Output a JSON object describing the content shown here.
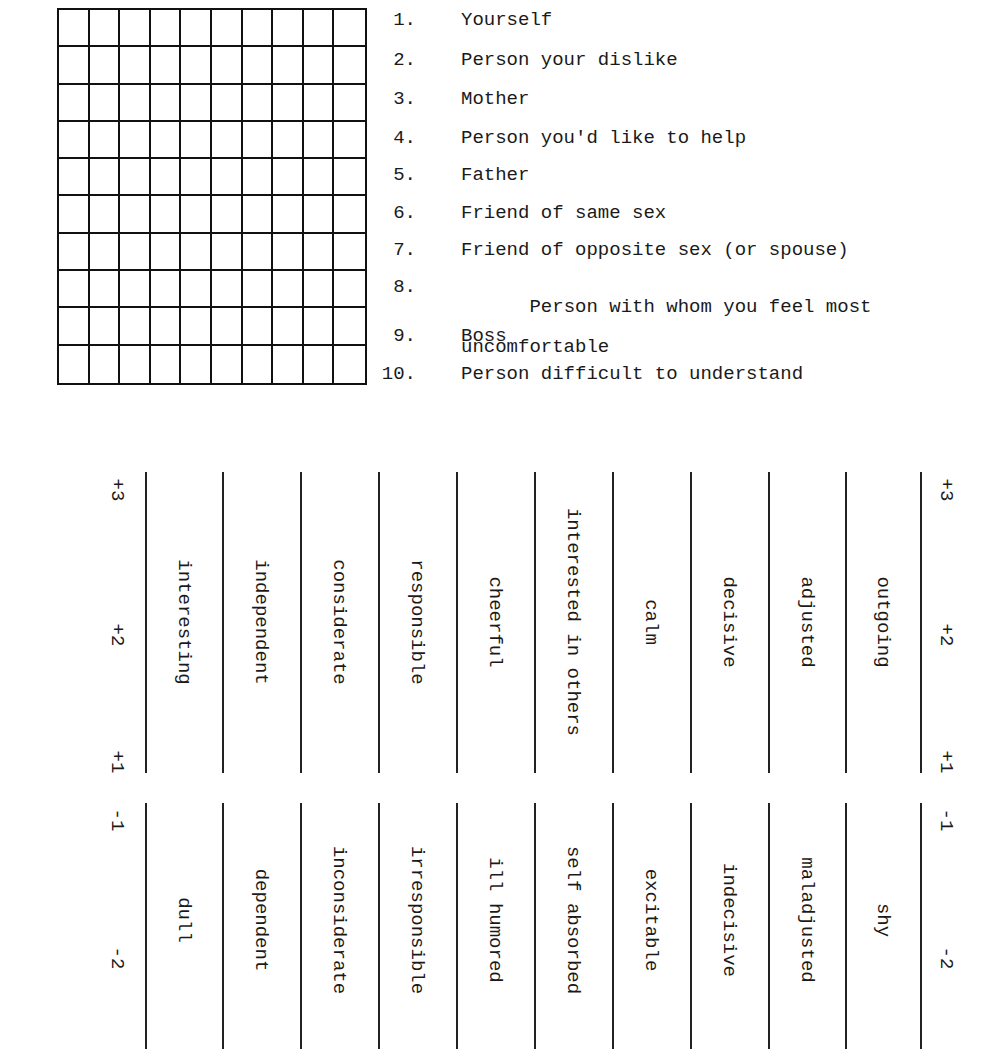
{
  "grid": {
    "rows": 10,
    "cols": 10
  },
  "people_list": [
    {
      "num": "1.",
      "label": "Yourself"
    },
    {
      "num": "2.",
      "label": "Person your dislike"
    },
    {
      "num": "3.",
      "label": "Mother"
    },
    {
      "num": "4.",
      "label": "Person you'd like to help"
    },
    {
      "num": "5.",
      "label": "Father"
    },
    {
      "num": "6.",
      "label": "Friend of same sex"
    },
    {
      "num": "7.",
      "label": "Friend of opposite sex (or spouse)"
    },
    {
      "num": "8.",
      "label": "Person with whom you feel most",
      "label_cont": "uncomfortable"
    },
    {
      "num": "9.",
      "label": "Boss"
    },
    {
      "num": "10.",
      "label": "Person difficult to understand"
    }
  ],
  "scale": {
    "positive_ticks": [
      "+3",
      "+2",
      "+1"
    ],
    "negative_ticks": [
      "-1",
      "-2"
    ],
    "positive_traits": [
      "interesting",
      "independent",
      "considerate",
      "responsible",
      "cheerful",
      "interested in others",
      "calm",
      "decisive",
      "adjusted",
      "outgoing"
    ],
    "negative_traits": [
      "dull",
      "dependent",
      "inconsiderate",
      "irresponsible",
      "ill humored",
      "self absorbed",
      "excitable",
      "indecisive",
      "maladjusted",
      "shy"
    ]
  }
}
